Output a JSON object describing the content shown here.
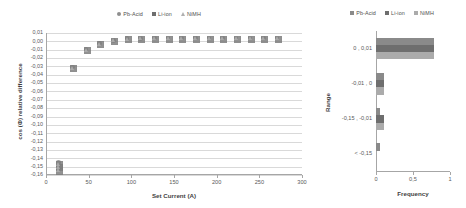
{
  "legend": {
    "entries": [
      {
        "label": "Pb-Acid",
        "marker": "circle-marker",
        "color": "#8e8e8e"
      },
      {
        "label": "Li-ion",
        "marker": "square-marker",
        "color": "#7f7f7f"
      },
      {
        "label": "NiMH",
        "marker": "triangle-marker",
        "color": "#b0b0b0"
      }
    ]
  },
  "chart_data": [
    {
      "id": "scatter",
      "type": "scatter",
      "title": "",
      "xlabel": "Set Current (A)",
      "ylabel": "cos (Φ) relative difference",
      "xlim": [
        0,
        300
      ],
      "ylim": [
        -0.16,
        0.01
      ],
      "xticks": [
        "0",
        "50",
        "100",
        "150",
        "200",
        "250",
        "300"
      ],
      "yticks": [
        "0,01",
        "0,00",
        "-0,01",
        "-0,02",
        "-0,03",
        "-0,04",
        "-0,05",
        "-0,06",
        "-0,07",
        "-0,08",
        "-0,09",
        "-0,10",
        "-0,11",
        "-0,12",
        "-0,13",
        "-0,14",
        "-0,15",
        "-0,16"
      ],
      "grid": true,
      "legend_position": "top",
      "series": [
        {
          "name": "Pb-Acid",
          "marker": "circle",
          "color": "#8e8e8e",
          "x": [
            15,
            15,
            15,
            31,
            47,
            63,
            79,
            95,
            111,
            127,
            143,
            159,
            175,
            191,
            207,
            223,
            239,
            255,
            271
          ],
          "y": [
            -0.145,
            -0.149,
            -0.153,
            -0.031,
            -0.01,
            -0.003,
            0.001,
            0.003,
            0.0035,
            0.004,
            0.004,
            0.004,
            0.004,
            0.004,
            0.004,
            0.004,
            0.004,
            0.004,
            0.004
          ]
        },
        {
          "name": "Li-ion",
          "marker": "square",
          "color": "#7f7f7f",
          "x": [
            15,
            15,
            15,
            31,
            47,
            63,
            79,
            95,
            111,
            127,
            143,
            159,
            175,
            191,
            207,
            223,
            239,
            255,
            271
          ],
          "y": [
            -0.146,
            -0.15,
            -0.154,
            -0.031,
            -0.01,
            -0.003,
            0.001,
            0.003,
            0.0035,
            0.004,
            0.004,
            0.004,
            0.004,
            0.004,
            0.004,
            0.004,
            0.004,
            0.004,
            0.004
          ]
        },
        {
          "name": "NiMH",
          "marker": "triangle",
          "color": "#b0b0b0",
          "x": [
            15,
            15,
            15,
            31,
            47,
            63,
            79,
            95,
            111,
            127,
            143,
            159,
            175,
            191,
            207,
            223,
            239,
            255,
            271
          ],
          "y": [
            -0.147,
            -0.151,
            -0.155,
            -0.032,
            -0.011,
            -0.0035,
            0.0008,
            0.0028,
            0.0033,
            0.0038,
            0.0038,
            0.0038,
            0.0038,
            0.0038,
            0.0038,
            0.0038,
            0.0038,
            0.0038,
            0.0038
          ]
        }
      ]
    },
    {
      "id": "frequency-bars",
      "type": "bar",
      "orientation": "horizontal",
      "title": "",
      "xlabel": "Frequency",
      "ylabel": "Range",
      "xlim": [
        0,
        1
      ],
      "xticks": [
        "0",
        "0,5",
        "1"
      ],
      "categories": [
        "0 , 0,01",
        "-0,01 , 0",
        "-0,15 , -0,01",
        "< -0,15"
      ],
      "grid": false,
      "legend_position": "top",
      "series": [
        {
          "name": "Pb-Acid",
          "color": "#8a8a8a",
          "values": [
            0.78,
            0.11,
            0.06,
            0.05
          ]
        },
        {
          "name": "Li-ion",
          "color": "#6e6e6e",
          "values": [
            0.78,
            0.11,
            0.11,
            0.0
          ]
        },
        {
          "name": "NiMH",
          "color": "#ababab",
          "values": [
            0.78,
            0.11,
            0.11,
            0.0
          ]
        }
      ]
    }
  ]
}
